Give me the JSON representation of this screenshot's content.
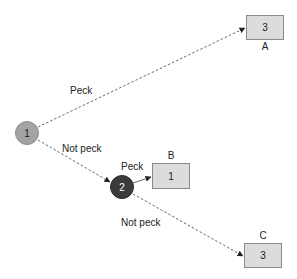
{
  "diagram": {
    "type": "decision-tree",
    "nodes": {
      "n1": {
        "label": "1",
        "fill": "#a3a3a3",
        "text_color": "#222222"
      },
      "n2": {
        "label": "2",
        "fill": "#3b3b3b",
        "text_color": "#ffffff"
      }
    },
    "outcomes": {
      "A": {
        "name": "A",
        "value": "3"
      },
      "B": {
        "name": "B",
        "value": "1"
      },
      "C": {
        "name": "C",
        "value": "3"
      }
    },
    "edges": {
      "n1_to_A": {
        "label": "Peck",
        "style": "dashed"
      },
      "n1_to_n2": {
        "label": "Not peck",
        "style": "dashed"
      },
      "n2_to_B": {
        "label": "Peck",
        "style": "solid"
      },
      "n2_to_C": {
        "label": "Not peck",
        "style": "dashed"
      }
    },
    "colors": {
      "box_fill": "#dcdcdc",
      "box_border": "#8a8a8a",
      "edge": "#6a6a6a"
    }
  }
}
